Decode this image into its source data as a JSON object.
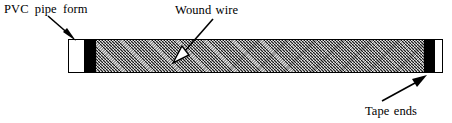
{
  "figure": {
    "background_color": "#ffffff",
    "line_color": "#000000",
    "winding_fill_color": "#9a9a9a",
    "tape_color": "#000000",
    "pipe_color": "#ffffff"
  },
  "labels": {
    "pvc_pipe_form": "PVC  pipe  form",
    "wound_wire": "Wound wire",
    "tape_ends": "Tape ends"
  },
  "annotations": [
    {
      "id": "pvc-pipe-form",
      "text": "PVC  pipe  form",
      "arrow_from": [
        48,
        16
      ],
      "arrow_to": [
        75,
        40
      ],
      "arrowhead_fill": "#000000"
    },
    {
      "id": "wound-wire",
      "text": "Wound wire",
      "arrow_from": [
        212,
        19
      ],
      "arrow_to": [
        175,
        61
      ],
      "arrowhead_fill": "#ffffff"
    },
    {
      "id": "tape-ends",
      "text": "Tape ends",
      "arrow_from": [
        382,
        100
      ],
      "arrow_to": [
        425,
        74
      ],
      "arrowhead_fill": "#000000"
    }
  ],
  "tube": {
    "segments": [
      {
        "name": "left-end-cap",
        "part": "PVC pipe form",
        "fill": "#ffffff"
      },
      {
        "name": "left-tape-band",
        "part": "Tape ends",
        "fill": "#000000"
      },
      {
        "name": "winding",
        "part": "Wound wire",
        "fill": "#9a9a9a"
      },
      {
        "name": "right-tape-band",
        "part": "Tape ends",
        "fill": "#000000"
      },
      {
        "name": "right-end-cap",
        "part": "PVC pipe form",
        "fill": "#ffffff"
      }
    ]
  }
}
